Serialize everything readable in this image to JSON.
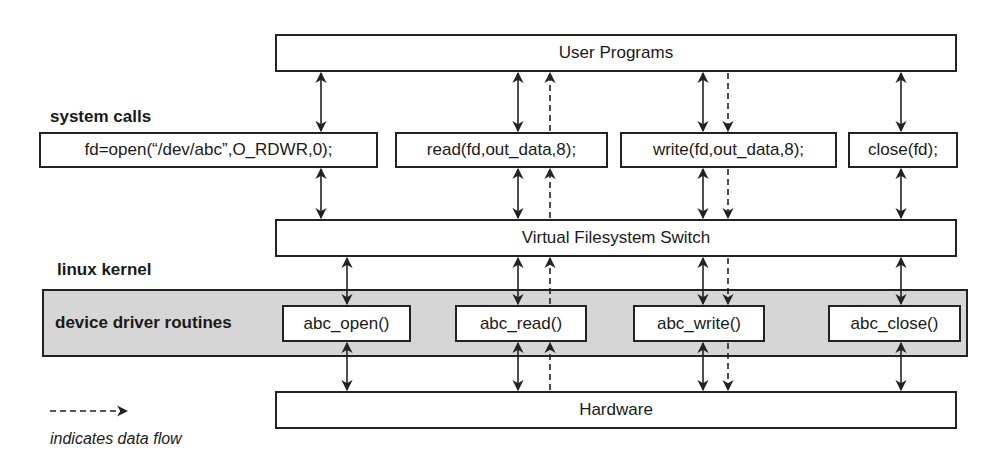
{
  "layers": {
    "user_programs": "User Programs",
    "vfs": "Virtual Filesystem Switch",
    "hardware": "Hardware"
  },
  "labels": {
    "system_calls": "system calls",
    "linux_kernel": "linux kernel",
    "device_driver_routines": "device driver routines"
  },
  "system_calls": [
    {
      "id": "open",
      "text": "fd=open(“/dev/abc”,O_RDWR,0);"
    },
    {
      "id": "read",
      "text": "read(fd,out_data,8);"
    },
    {
      "id": "write",
      "text": "write(fd,out_data,8);"
    },
    {
      "id": "close",
      "text": "close(fd);"
    }
  ],
  "driver_routines": [
    {
      "id": "open",
      "text": "abc_open()"
    },
    {
      "id": "read",
      "text": "abc_read()"
    },
    {
      "id": "write",
      "text": "abc_write()"
    },
    {
      "id": "close",
      "text": "abc_close()"
    }
  ],
  "legend": {
    "text": "indicates data flow",
    "symbol": "dashed-arrow"
  },
  "colors": {
    "line": "#222222",
    "kernel_fill": "#d6d6d6"
  }
}
